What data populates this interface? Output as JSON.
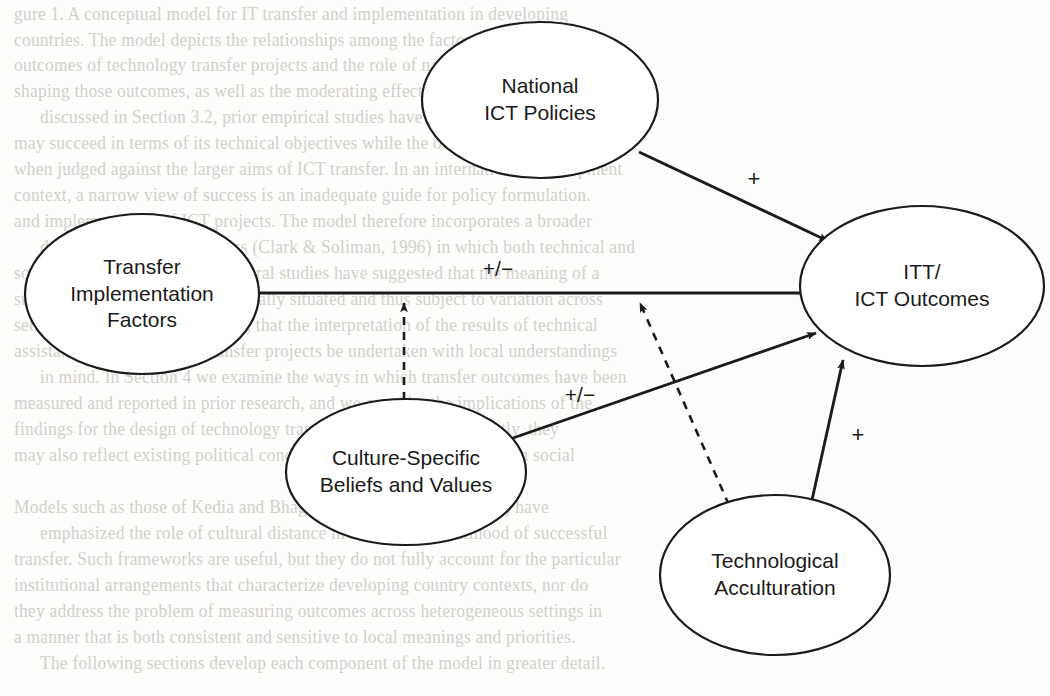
{
  "figure": {
    "type": "conceptual-model-diagram",
    "title": "",
    "nodes": [
      {
        "id": "national-ict-policies",
        "label_lines": [
          "National",
          "ICT Policies"
        ],
        "cx": 540,
        "cy": 100,
        "rx": 118,
        "ry": 78
      },
      {
        "id": "transfer-implementation-factors",
        "label_lines": [
          "Transfer",
          "Implementation",
          "Factors"
        ],
        "cx": 142,
        "cy": 294,
        "rx": 117,
        "ry": 80
      },
      {
        "id": "itt-ict-outcomes",
        "label_lines": [
          "ITT/",
          "ICT Outcomes"
        ],
        "cx": 922,
        "cy": 286,
        "rx": 122,
        "ry": 80
      },
      {
        "id": "culture-specific-beliefs-and-values",
        "label_lines": [
          "Culture-Specific",
          "Beliefs and Values"
        ],
        "cx": 406,
        "cy": 472,
        "rx": 120,
        "ry": 73
      },
      {
        "id": "technological-acculturation",
        "label_lines": [
          "Technological",
          "Acculturation"
        ],
        "cx": 775,
        "cy": 575,
        "rx": 115,
        "ry": 80
      }
    ],
    "edges": [
      {
        "id": "policies-to-outcomes",
        "from": "national-ict-policies",
        "to": "itt-ict-outcomes",
        "style": "solid",
        "sign": "+",
        "sign_x": 754,
        "sign_y": 179
      },
      {
        "id": "transfer-to-outcomes",
        "from": "transfer-implementation-factors",
        "to": "itt-ict-outcomes",
        "style": "solid",
        "sign": "+/−",
        "sign_x": 498,
        "sign_y": 268
      },
      {
        "id": "culture-to-outcomes",
        "from": "culture-specific-beliefs-and-values",
        "to": "itt-ict-outcomes",
        "style": "solid",
        "sign": "+/−",
        "sign_x": 580,
        "sign_y": 394
      },
      {
        "id": "acculturation-to-outcomes",
        "from": "technological-acculturation",
        "to": "itt-ict-outcomes",
        "style": "solid",
        "sign": "+",
        "sign_x": 858,
        "sign_y": 435
      },
      {
        "id": "culture-moderates-transfer-path",
        "from": "culture-specific-beliefs-and-values",
        "to": "transfer-to-outcomes",
        "style": "dashed",
        "sign": "",
        "sign_x": 0,
        "sign_y": 0
      },
      {
        "id": "acculturation-moderates-transfer-path",
        "from": "technological-acculturation",
        "to": "transfer-to-outcomes",
        "style": "dashed",
        "sign": "",
        "sign_x": 0,
        "sign_y": 0
      }
    ],
    "colors": {
      "stroke": "#1b1b1b",
      "fill": "#ffffff",
      "text": "#1b1b1b",
      "background": "#fdfdfc",
      "bleed_text": "#cdcbc6"
    }
  },
  "background_text": {
    "note": "faint bleed-through text from reverse side of scanned page",
    "lines": [
      {
        "y": 6,
        "text": "gure 1.  A conceptual model for IT transfer and implementation in developing"
      },
      {
        "y": 32,
        "text": "countries. The model depicts the relationships among the factors that shape the"
      },
      {
        "y": 57,
        "text": "outcomes of technology transfer projects and the role of national policy in"
      },
      {
        "y": 83,
        "text": "shaping those outcomes, as well as the moderating effects of local culture."
      },
      {
        "y": 109,
        "text": "discussed in Section 3.2, prior empirical studies have demonstrated that a project"
      },
      {
        "y": 135,
        "text": "may succeed in terms of its technical objectives while the outcomes are unsatisfactory"
      },
      {
        "y": 161,
        "text": "when judged against the larger aims of ICT transfer. In an international development"
      },
      {
        "y": 187,
        "text": "context, a narrow view of success is an inadequate guide for policy formulation."
      },
      {
        "y": 213,
        "text": "and implementation of ICT projects. The model therefore incorporates a broader"
      },
      {
        "y": 239,
        "text": "definition of transfer success (Clark & Soliman, 1996) in which both technical and"
      },
      {
        "y": 265,
        "text": "social criteria are evaluated. Several studies have suggested that the meaning of a"
      },
      {
        "y": 291,
        "text": "successful outcome is itself culturally situated and thus subject to variation across"
      },
      {
        "y": 317,
        "text": "settings. It is essential, therefore, that the interpretation of the results of technical"
      },
      {
        "y": 343,
        "text": "assistance and technology transfer projects be undertaken with local understandings"
      },
      {
        "y": 369,
        "text": "in mind. In Section 4 we examine the ways in which transfer outcomes have been"
      },
      {
        "y": 395,
        "text": "measured and reported in prior research, and we consider the implications of the"
      },
      {
        "y": 421,
        "text": "findings for the design of technology transfer programs. Consequently, they"
      },
      {
        "y": 447,
        "text": "may also reflect existing political conditions, as well as the longer-term social"
      },
      {
        "y": 499,
        "text": "Models such as those of Kedia and Bhagat (1988) and Rogers (1995) have"
      },
      {
        "y": 525,
        "text": "emphasized the role of cultural distance in shaping the likelihood of successful"
      },
      {
        "y": 551,
        "text": "transfer. Such frameworks are useful, but they do not fully account for the particular"
      },
      {
        "y": 577,
        "text": "institutional arrangements that characterize developing country contexts, nor do"
      },
      {
        "y": 603,
        "text": "they address the problem of measuring outcomes across heterogeneous settings in"
      },
      {
        "y": 629,
        "text": "a manner that is both consistent and sensitive to local meanings and priorities."
      },
      {
        "y": 655,
        "text": "The following sections develop each component of the model in greater detail."
      },
      {
        "y": 681,
        "text": ""
      }
    ]
  }
}
